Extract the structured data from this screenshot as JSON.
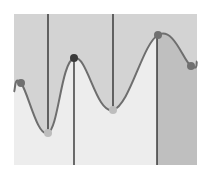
{
  "chart_data": {
    "type": "line",
    "title": "",
    "xlabel": "",
    "ylabel": "",
    "grid": false,
    "legend": null,
    "plot_area": {
      "x0": 14,
      "y0": 14,
      "x1": 197,
      "y1": 165
    },
    "colors": {
      "above_curve_fill": "#d3d3d3",
      "below_curve_fill": "#ededed",
      "below_curve_right_fill": "#bfbfbf",
      "line": "#6e6e6e",
      "marker_dark": "#3a3a3a",
      "marker_light": "#bdbdbd",
      "marker_mid": "#707070",
      "vline": "#222222"
    },
    "curve": {
      "start": [
        14,
        92
      ],
      "end": [
        197,
        61
      ]
    },
    "points": [
      {
        "x": 21,
        "y": 83,
        "style": "mid"
      },
      {
        "x": 48,
        "y": 133,
        "style": "light"
      },
      {
        "x": 74,
        "y": 58,
        "style": "dark"
      },
      {
        "x": 113,
        "y": 110,
        "style": "light"
      },
      {
        "x": 158,
        "y": 35,
        "style": "mid"
      },
      {
        "x": 191,
        "y": 66,
        "style": "mid"
      }
    ],
    "vertical_lines": [
      {
        "x": 48,
        "from": "top",
        "to_point": 1
      },
      {
        "x": 74,
        "from_point": 2,
        "to": "bottom"
      },
      {
        "x": 113,
        "from": "top",
        "to_point": 3
      },
      {
        "x": 157,
        "from_point": 4,
        "to": "bottom"
      }
    ],
    "split_x": 157
  }
}
